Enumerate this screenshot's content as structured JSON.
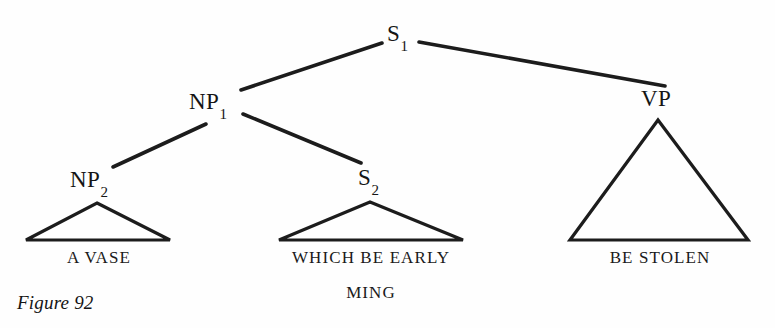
{
  "figure": {
    "caption": "Figure 92",
    "caption_x": 17,
    "caption_y": 292
  },
  "colors": {
    "background": "#fefefe",
    "ink": "#1a1a1a",
    "line": "#1c1c1c"
  },
  "tree": {
    "nodes": [
      {
        "id": "S1",
        "base": "S",
        "subscript": "1",
        "x": 387,
        "y": 22,
        "role": "root-sentence"
      },
      {
        "id": "NP1",
        "base": "NP",
        "subscript": "1",
        "x": 189,
        "y": 90,
        "role": "noun-phrase"
      },
      {
        "id": "VP",
        "base": "VP",
        "subscript": "",
        "x": 641,
        "y": 87,
        "role": "verb-phrase"
      },
      {
        "id": "NP2",
        "base": "NP",
        "subscript": "2",
        "x": 70,
        "y": 168,
        "role": "noun-phrase"
      },
      {
        "id": "S2",
        "base": "S",
        "subscript": "2",
        "x": 358,
        "y": 166,
        "role": "embedded-sentence"
      }
    ],
    "edges": [
      {
        "id": "S1-NP1",
        "from": "S1",
        "to": "NP1",
        "x1": 382,
        "y1": 43,
        "x2": 241,
        "y2": 90
      },
      {
        "id": "S1-VP",
        "from": "S1",
        "to": "VP",
        "x1": 419,
        "y1": 42,
        "x2": 665,
        "y2": 86
      },
      {
        "id": "NP1-NP2",
        "from": "NP1",
        "to": "NP2",
        "x1": 206,
        "y1": 124,
        "x2": 113,
        "y2": 167
      },
      {
        "id": "NP1-S2",
        "from": "NP1",
        "to": "S2",
        "x1": 243,
        "y1": 114,
        "x2": 361,
        "y2": 163
      }
    ],
    "triangles": [
      {
        "id": "tri-np2",
        "parent": "NP2",
        "apex_x": 97,
        "apex_y": 203,
        "left_x": 26,
        "right_x": 170,
        "base_y": 240
      },
      {
        "id": "tri-s2",
        "parent": "S2",
        "apex_x": 370,
        "apex_y": 202,
        "left_x": 279,
        "right_x": 463,
        "base_y": 240
      },
      {
        "id": "tri-vp",
        "parent": "VP",
        "apex_x": 658,
        "apex_y": 120,
        "left_x": 570,
        "right_x": 748,
        "base_y": 240
      }
    ],
    "terminals": [
      {
        "id": "term-np2",
        "parent": "NP2",
        "lines": [
          "A VASE"
        ],
        "center_x": 99,
        "y": 249
      },
      {
        "id": "term-s2",
        "parent": "S2",
        "lines": [
          "WHICH BE EARLY",
          "MING"
        ],
        "center_x": 371,
        "y": 249
      },
      {
        "id": "term-vp",
        "parent": "VP",
        "lines": [
          "BE STOLEN"
        ],
        "center_x": 660,
        "y": 249
      }
    ]
  }
}
